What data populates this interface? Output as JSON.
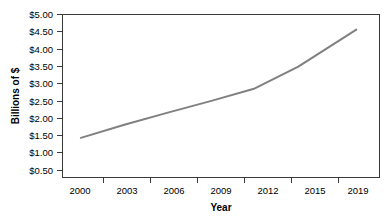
{
  "chart_data": {
    "type": "line",
    "title": "",
    "xlabel": "Year",
    "ylabel": "Billions of $",
    "x": [
      2000,
      2003,
      2006,
      2009,
      2012,
      2015,
      2019
    ],
    "xtick_labels": [
      "2000",
      "2003",
      "2006",
      "2009",
      "2012",
      "2015",
      "2019"
    ],
    "ytick_labels": [
      "$0.50",
      "$1.00",
      "$1.50",
      "$2.00",
      "$2.50",
      "$3.00",
      "$3.50",
      "$4.00",
      "$4.50",
      "$5.00"
    ],
    "ytick_values": [
      0.5,
      1.0,
      1.5,
      2.0,
      2.5,
      3.0,
      3.5,
      4.0,
      4.5,
      5.0
    ],
    "series": [
      {
        "name": "Billions of $",
        "color": "#808080",
        "values": [
          1.33,
          1.72,
          2.08,
          2.43,
          2.8,
          3.45,
          4.55
        ]
      }
    ],
    "xlim": [
      1998.7,
      2020.6
    ],
    "ylim": [
      0.15,
      5.0
    ],
    "grid": false,
    "legend": false
  },
  "labels": {
    "y_axis_title": "Billions of $",
    "x_axis_title": "Year",
    "y_ticks": [
      "$5.00",
      "$4.50",
      "$4.00",
      "$3.50",
      "$3.00",
      "$2.50",
      "$2.00",
      "$1.50",
      "$1.00",
      "$0.50"
    ],
    "x_ticks": [
      "2000",
      "2003",
      "2006",
      "2009",
      "2012",
      "2015",
      "2019"
    ]
  },
  "colors": {
    "line": "#808080",
    "axis": "#3a3a3a",
    "text": "#000000",
    "background": "#ffffff"
  }
}
